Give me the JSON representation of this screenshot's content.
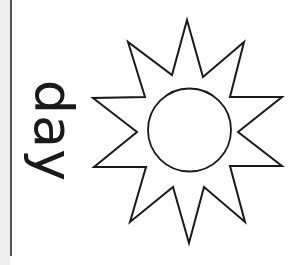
{
  "worksheet": {
    "word": "day",
    "illustration": "sun-icon",
    "colors": {
      "background": "#ffffff",
      "line": "#1a1a1a",
      "left_strip": "#eeeeee",
      "left_rule": "#555555"
    }
  }
}
